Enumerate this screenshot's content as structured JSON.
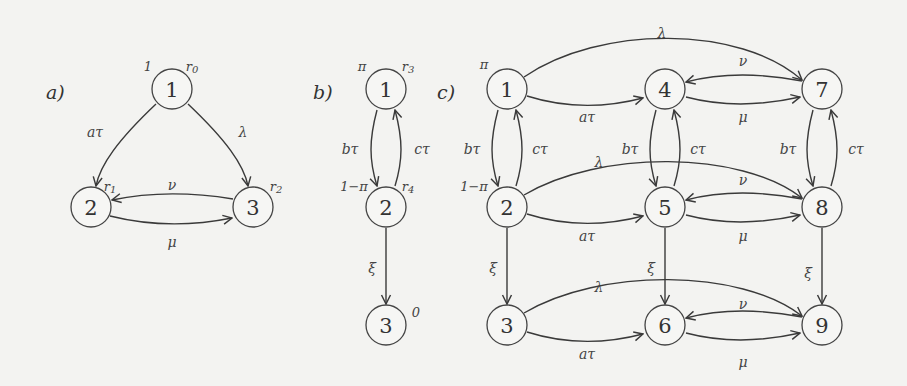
{
  "figure": {
    "panels": [
      {
        "id": "a",
        "label": "a)",
        "nodes": [
          {
            "id": "1",
            "label": "1",
            "init": "1",
            "reward": "r0"
          },
          {
            "id": "2",
            "label": "2",
            "reward": "r1"
          },
          {
            "id": "3",
            "label": "3",
            "reward": "r2"
          }
        ],
        "edges": [
          {
            "from": "1",
            "to": "2",
            "label": "aτ"
          },
          {
            "from": "1",
            "to": "3",
            "label": "λ"
          },
          {
            "from": "3",
            "to": "2",
            "label": "ν"
          },
          {
            "from": "2",
            "to": "3",
            "label": "μ"
          }
        ]
      },
      {
        "id": "b",
        "label": "b)",
        "nodes": [
          {
            "id": "1",
            "label": "1",
            "init": "π",
            "reward": "r3"
          },
          {
            "id": "2",
            "label": "2",
            "init": "1−π",
            "reward": "r4"
          },
          {
            "id": "3",
            "label": "3",
            "reward": "0"
          }
        ],
        "edges": [
          {
            "from": "1",
            "to": "2",
            "label": "bτ"
          },
          {
            "from": "2",
            "to": "1",
            "label": "cτ"
          },
          {
            "from": "2",
            "to": "3",
            "label": "ξ"
          }
        ]
      },
      {
        "id": "c",
        "label": "c)",
        "nodes": [
          {
            "id": "1",
            "label": "1",
            "init": "π"
          },
          {
            "id": "2",
            "label": "2",
            "init": "1−π"
          },
          {
            "id": "3",
            "label": "3"
          },
          {
            "id": "4",
            "label": "4"
          },
          {
            "id": "5",
            "label": "5"
          },
          {
            "id": "6",
            "label": "6"
          },
          {
            "id": "7",
            "label": "7"
          },
          {
            "id": "8",
            "label": "8"
          },
          {
            "id": "9",
            "label": "9"
          }
        ],
        "edges": [
          {
            "from": "1",
            "to": "4",
            "label": "aτ"
          },
          {
            "from": "1",
            "to": "7",
            "label": "λ"
          },
          {
            "from": "7",
            "to": "4",
            "label": "ν"
          },
          {
            "from": "4",
            "to": "7",
            "label": "μ"
          },
          {
            "from": "1",
            "to": "2",
            "label": "bτ"
          },
          {
            "from": "2",
            "to": "1",
            "label": "cτ"
          },
          {
            "from": "4",
            "to": "5",
            "label": "bτ"
          },
          {
            "from": "5",
            "to": "4",
            "label": "cτ"
          },
          {
            "from": "7",
            "to": "8",
            "label": "bτ"
          },
          {
            "from": "8",
            "to": "7",
            "label": "cτ"
          },
          {
            "from": "2",
            "to": "5",
            "label": "aτ"
          },
          {
            "from": "2",
            "to": "8",
            "label": "λ"
          },
          {
            "from": "8",
            "to": "5",
            "label": "ν"
          },
          {
            "from": "5",
            "to": "8",
            "label": "μ"
          },
          {
            "from": "2",
            "to": "3",
            "label": "ξ"
          },
          {
            "from": "5",
            "to": "6",
            "label": "ξ"
          },
          {
            "from": "8",
            "to": "9",
            "label": "ξ"
          },
          {
            "from": "3",
            "to": "6",
            "label": "aτ"
          },
          {
            "from": "3",
            "to": "9",
            "label": "λ"
          },
          {
            "from": "9",
            "to": "6",
            "label": "ν"
          },
          {
            "from": "6",
            "to": "9",
            "label": "μ"
          }
        ]
      }
    ]
  },
  "text": {
    "a_label": "a)",
    "b_label": "b)",
    "c_label": "c)",
    "n1": "1",
    "n2": "2",
    "n3": "3",
    "n4": "4",
    "n5": "5",
    "n6": "6",
    "n7": "7",
    "n8": "8",
    "n9": "9",
    "atau": "aτ",
    "btau": "bτ",
    "ctau": "cτ",
    "lambda": "λ",
    "nu": "ν",
    "mu": "μ",
    "xi": "ξ",
    "pi": "π",
    "one_minus_pi": "1−π",
    "one": "1",
    "zero": "0",
    "r0": "r",
    "r0_sub": "0",
    "r1": "r",
    "r1_sub": "1",
    "r2": "r",
    "r2_sub": "2",
    "r3": "r",
    "r3_sub": "3",
    "r4": "r",
    "r4_sub": "4"
  }
}
